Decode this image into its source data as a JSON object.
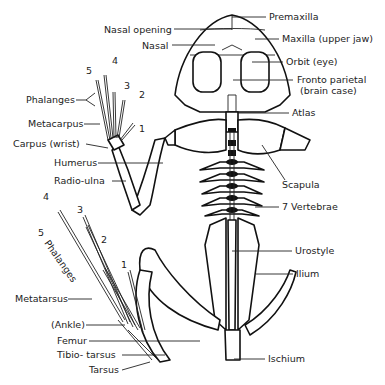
{
  "diagram": {
    "labels_right": {
      "premaxilla": "Premaxilla",
      "maxilla": "Maxilla (upper jaw)",
      "orbit": "Orbit (eye)",
      "fronto_parietal_1": "Fronto parietal",
      "fronto_parietal_2": "(brain case)",
      "atlas": "Atlas",
      "scapula": "Scapula",
      "vertebrae": "7 Vertebrae",
      "urostyle": "Urostyle",
      "ilium": "Ilium",
      "ischium": "Ischium"
    },
    "labels_left": {
      "nasal_opening": "Nasal opening",
      "nasal": "Nasal",
      "phalanges_fore": "Phalanges",
      "metacarpus": "Metacarpus",
      "carpus": "Carpus (wrist)",
      "humerus": "Humerus",
      "radio_ulna": "Radio-ulna",
      "phalanges_hind": "Phalanges",
      "metatarsus": "Metatarsus",
      "ankle": "(Ankle)",
      "femur": "Femur",
      "tibio_tarsus": "Tibio- tarsus",
      "tarsus": "Tarsus"
    },
    "digit_numbers_fore": [
      "5",
      "4",
      "3",
      "2",
      "1"
    ],
    "digit_numbers_hind": [
      "4",
      "3",
      "5",
      "2",
      "1"
    ]
  }
}
